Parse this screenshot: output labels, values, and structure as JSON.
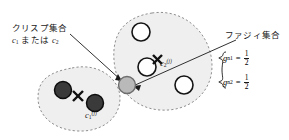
{
  "figure": {
    "type": "fuzzy-clustering-diagram",
    "background": "#ffffff",
    "ink": "#1a1a1a"
  },
  "annotations": {
    "crisp_label": "クリスプ集合",
    "crisp_sublabel_c": "c",
    "crisp_sublabel_1": "1",
    "crisp_sublabel_mid": " または ",
    "crisp_sublabel_c2": "c",
    "crisp_sublabel_2": "2",
    "fuzzy_label": "ファジィ集合"
  },
  "centers": {
    "left": {
      "symbol": "c",
      "subscript": "1",
      "superscript": "(j)"
    },
    "right": {
      "symbol": "c",
      "subscript": "2",
      "superscript": "(j)"
    }
  },
  "equations": [
    {
      "lhs_symbol": "g",
      "lhs_sub": "n1",
      "eq": "=",
      "numerator": "1",
      "denominator": "2"
    },
    {
      "lhs_symbol": "g",
      "lhs_sub": "n2",
      "eq": "=",
      "numerator": "1",
      "denominator": "2"
    }
  ],
  "clusters": {
    "left": {
      "name": "crisp-cluster-left",
      "fill": "#efefef",
      "border": "#8a8a8a",
      "points": [
        {
          "cx": 63,
          "cy": 90,
          "r": 8.5,
          "style": "filled-dark"
        },
        {
          "cx": 95,
          "cy": 103,
          "r": 8.5,
          "style": "filled-dark"
        }
      ],
      "center_marker": {
        "x": 78,
        "y": 96
      }
    },
    "right": {
      "name": "fuzzy-cluster-right",
      "fill": "#efefef",
      "border": "#8a8a8a",
      "points": [
        {
          "cx": 141,
          "cy": 32,
          "r": 9,
          "style": "hollow"
        },
        {
          "cx": 147,
          "cy": 67,
          "r": 9,
          "style": "hollow"
        },
        {
          "cx": 184,
          "cy": 85,
          "r": 9,
          "style": "hollow"
        }
      ],
      "center_marker": {
        "x": 163,
        "y": 60
      }
    },
    "shared_point": {
      "name": "boundary-point",
      "cx": 127,
      "cy": 85,
      "r": 8.5,
      "fill": "#b8b8b8",
      "style": "filled-gray"
    }
  },
  "point_colors": {
    "dark_fill": "#3a3a3a",
    "dark_ring": "#111111",
    "hollow_fill": "#ffffff",
    "hollow_ring": "#111111",
    "gray_fill": "#b9b9b9",
    "gray_ring": "#6d6d6d"
  }
}
